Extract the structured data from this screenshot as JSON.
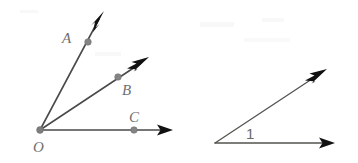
{
  "figure": {
    "canvas": {
      "width": 358,
      "height": 163,
      "background": "#ffffff"
    },
    "colors": {
      "line": "#4a4a4a",
      "arrow": "#111111",
      "dot": "#848484",
      "label": "#6f6f6f",
      "background": "#ffffff"
    }
  },
  "diagram_left": {
    "name": "rays-from-vertex-o",
    "vertex": {
      "label": "O",
      "label_x": 33,
      "label_y": 152,
      "x": 40,
      "y": 130
    },
    "rays": [
      {
        "name": "ray-oa",
        "point_label": "A",
        "point_x": 88,
        "point_y": 42,
        "label_x": 62,
        "label_y": 43,
        "tip_x": 104,
        "tip_y": 12
      },
      {
        "name": "ray-ob",
        "point_label": "B",
        "point_x": 118,
        "point_y": 77,
        "label_x": 122,
        "label_y": 95,
        "tip_x": 149,
        "tip_y": 57
      },
      {
        "name": "ray-oc",
        "point_label": "C",
        "point_x": 134,
        "point_y": 130,
        "label_x": 129,
        "label_y": 122,
        "tip_x": 173,
        "tip_y": 130
      }
    ]
  },
  "diagram_right": {
    "name": "angle-one",
    "vertex": {
      "x": 215,
      "y": 143
    },
    "angle_label": "1",
    "angle_label_x": 246,
    "angle_label_y": 139,
    "rays": [
      {
        "name": "ray-upper-right",
        "tip_x": 327,
        "tip_y": 69
      },
      {
        "name": "ray-horizontal-right",
        "tip_x": 335,
        "tip_y": 143
      }
    ]
  }
}
